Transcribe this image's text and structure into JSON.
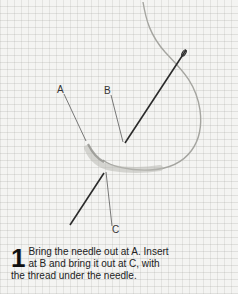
{
  "figure": {
    "labels": [
      {
        "id": "A",
        "text": "A"
      },
      {
        "id": "B",
        "text": "B"
      },
      {
        "id": "C",
        "text": "C"
      }
    ],
    "step": {
      "number": "1",
      "text": "Bring the needle out at A. Insert at B and bring it out at C, with the thread under the needle."
    },
    "colors": {
      "fabric": "#f4f4f2",
      "thread": "#9a9a96",
      "needle": "#2a2a2a"
    }
  }
}
